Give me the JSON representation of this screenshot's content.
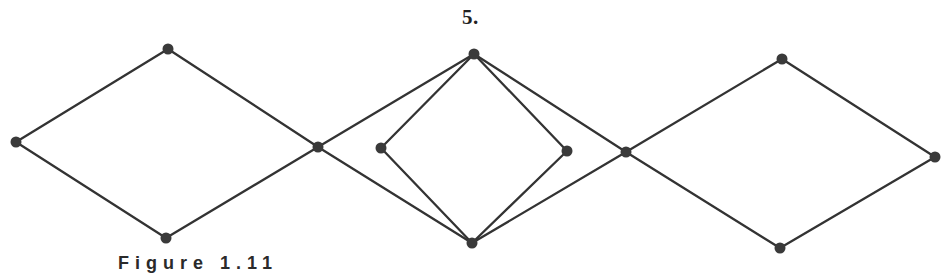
{
  "figure": {
    "label": "5.",
    "caption_partial": "Figure 1.11"
  },
  "graph": {
    "node_color": "#3a3a3a",
    "edge_color": "#333333",
    "nodes": [
      {
        "id": "L1",
        "x": 16,
        "y": 142,
        "role": "left-diamond-left"
      },
      {
        "id": "L2",
        "x": 168,
        "y": 49,
        "role": "left-diamond-top"
      },
      {
        "id": "L3",
        "x": 166,
        "y": 238,
        "role": "left-diamond-bottom"
      },
      {
        "id": "C1",
        "x": 318,
        "y": 147,
        "role": "junction-left"
      },
      {
        "id": "M1",
        "x": 474,
        "y": 54,
        "role": "middle-top"
      },
      {
        "id": "M2",
        "x": 381,
        "y": 148,
        "role": "inner-left"
      },
      {
        "id": "M3",
        "x": 567,
        "y": 151,
        "role": "inner-right"
      },
      {
        "id": "M4",
        "x": 472,
        "y": 243,
        "role": "middle-bottom"
      },
      {
        "id": "C2",
        "x": 626,
        "y": 152,
        "role": "junction-right"
      },
      {
        "id": "R1",
        "x": 782,
        "y": 59,
        "role": "right-diamond-top"
      },
      {
        "id": "R2",
        "x": 780,
        "y": 248,
        "role": "right-diamond-bottom"
      },
      {
        "id": "R3",
        "x": 935,
        "y": 157,
        "role": "right-diamond-right"
      }
    ],
    "edges": [
      [
        "L1",
        "L2"
      ],
      [
        "L1",
        "L3"
      ],
      [
        "L2",
        "C1"
      ],
      [
        "L3",
        "C1"
      ],
      [
        "C1",
        "M1"
      ],
      [
        "C1",
        "M4"
      ],
      [
        "M1",
        "M2"
      ],
      [
        "M1",
        "M3"
      ],
      [
        "M2",
        "M4"
      ],
      [
        "M3",
        "M4"
      ],
      [
        "M1",
        "C2"
      ],
      [
        "M4",
        "C2"
      ],
      [
        "C2",
        "R1"
      ],
      [
        "C2",
        "R2"
      ],
      [
        "R1",
        "R3"
      ],
      [
        "R2",
        "R3"
      ]
    ]
  }
}
